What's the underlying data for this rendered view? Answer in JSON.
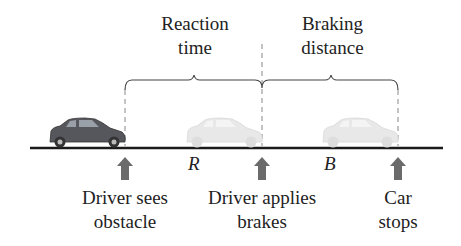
{
  "diagram": {
    "top_labels": {
      "reaction": [
        "Reaction",
        "time"
      ],
      "braking": [
        "Braking",
        "distance"
      ]
    },
    "segment_vars": {
      "reaction": "R",
      "braking": "B"
    },
    "events": [
      {
        "line1": "Driver sees",
        "line2": "obstacle"
      },
      {
        "line1": "Driver applies",
        "line2": "brakes"
      },
      {
        "line1": "Car",
        "line2": "stops"
      }
    ],
    "colors": {
      "arrow": "#6b6b6b",
      "car_dark": "#5a5a5e",
      "car_ghost": "#e6e6e6",
      "ground": "#1a1a1a"
    }
  }
}
